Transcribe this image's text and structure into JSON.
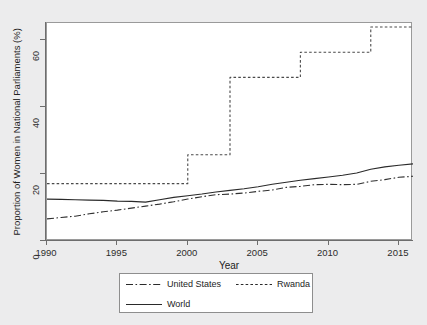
{
  "figure": {
    "background_color": "#ececed",
    "plot_background_color": "#ffffff",
    "frame_color": "#9a9a9a"
  },
  "chart_data": {
    "type": "line",
    "title": "",
    "subtitle": "",
    "xlabel": "Year",
    "ylabel": "Proportion of Women in National Parliaments (%)",
    "xlim": [
      1990,
      2016
    ],
    "ylim": [
      0,
      65
    ],
    "xticks": [
      1990,
      1995,
      2000,
      2005,
      2010,
      2015
    ],
    "xticklabels": [
      "1990",
      "1995",
      "2000",
      "2005",
      "2010",
      "2015"
    ],
    "yticks": [
      0,
      20,
      40,
      60
    ],
    "yticklabels": [
      "0",
      "20",
      "40",
      "60"
    ],
    "grid": false,
    "legend_position": "below-center",
    "x": [
      1990,
      1991,
      1992,
      1993,
      1994,
      1995,
      1996,
      1997,
      1998,
      1999,
      2000,
      2001,
      2002,
      2003,
      2004,
      2005,
      2006,
      2007,
      2008,
      2009,
      2010,
      2011,
      2012,
      2013,
      2014,
      2015,
      2016
    ],
    "series": [
      {
        "name": "United States",
        "style": "dash-dot",
        "color": "#303030",
        "values": [
          6.6,
          7.0,
          7.4,
          8.1,
          8.7,
          9.2,
          9.8,
          10.4,
          11.0,
          11.7,
          12.5,
          13.2,
          13.8,
          14.0,
          14.3,
          14.8,
          15.2,
          16.0,
          16.3,
          16.8,
          16.9,
          16.8,
          16.9,
          17.8,
          18.3,
          19.0,
          19.3
        ]
      },
      {
        "name": "Rwanda",
        "style": "dotted",
        "color": "#4a4a4a",
        "values": [
          17.1,
          17.1,
          17.1,
          17.1,
          17.1,
          17.1,
          17.1,
          17.1,
          17.1,
          17.1,
          25.7,
          25.7,
          25.7,
          48.8,
          48.8,
          48.8,
          48.8,
          48.8,
          56.3,
          56.3,
          56.3,
          56.3,
          56.3,
          63.8,
          63.8,
          63.8,
          63.8
        ]
      },
      {
        "name": "World",
        "style": "solid",
        "color": "#2a2a2a",
        "values": [
          12.5,
          12.4,
          12.3,
          12.2,
          12.1,
          11.9,
          11.8,
          11.6,
          12.3,
          13.0,
          13.5,
          14.0,
          14.6,
          15.1,
          15.6,
          16.2,
          16.9,
          17.5,
          18.1,
          18.6,
          19.1,
          19.6,
          20.3,
          21.4,
          22.1,
          22.6,
          23.0
        ]
      }
    ]
  },
  "legend": {
    "entries": [
      {
        "label": "United States",
        "style": "dash-dot"
      },
      {
        "label": "Rwanda",
        "style": "dotted"
      },
      {
        "label": "World",
        "style": "solid"
      }
    ]
  }
}
